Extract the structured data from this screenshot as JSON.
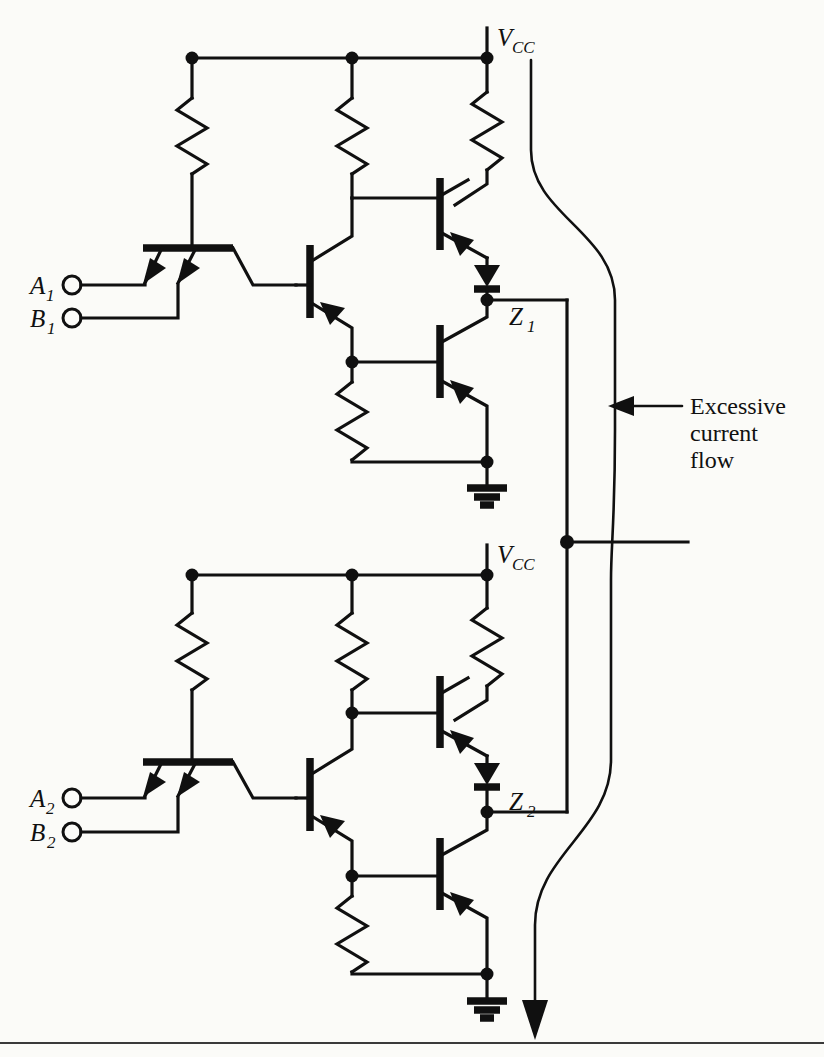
{
  "figure": {
    "background_color": "#fbfbf8",
    "ink_color": "#101010"
  },
  "labels": {
    "supply_top": {
      "symbol": "V",
      "subscript": "CC"
    },
    "supply_bottom": {
      "symbol": "V",
      "subscript": "CC"
    },
    "input_a1": {
      "symbol": "A",
      "subscript": "1"
    },
    "input_b1": {
      "symbol": "B",
      "subscript": "1"
    },
    "input_a2": {
      "symbol": "A",
      "subscript": "2"
    },
    "input_b2": {
      "symbol": "B",
      "subscript": "2"
    },
    "output_z1": {
      "symbol": "Z",
      "subscript": "1"
    },
    "output_z2": {
      "symbol": "Z",
      "subscript": "2"
    }
  },
  "annotation": {
    "line1": "Excessive",
    "line2": "current",
    "line3": "flow"
  },
  "components": {
    "gate_top": {
      "name": "TTL NAND gate 1",
      "resistors": [
        "R1 input pull-up",
        "R2 collector load",
        "R3 totem-pole upper",
        "R4 emitter resistor"
      ],
      "transistors": [
        "Q1 multi-emitter input",
        "Q2 phase splitter",
        "Q3 totem-pole upper",
        "Q4 totem-pole lower"
      ],
      "diodes": [
        "D1 level-shift diode"
      ],
      "ground": "GND"
    },
    "gate_bottom": {
      "name": "TTL NAND gate 2",
      "resistors": [
        "R1 input pull-up",
        "R2 collector load",
        "R3 totem-pole upper",
        "R4 emitter resistor"
      ],
      "transistors": [
        "Q1 multi-emitter input",
        "Q2 phase splitter",
        "Q3 totem-pole upper",
        "Q4 totem-pole lower"
      ],
      "diodes": [
        "D1 level-shift diode"
      ],
      "ground": "GND"
    },
    "tie_node": "Outputs Z1 and Z2 wired together"
  },
  "icons": {
    "supply_rail": "vcc-rail-icon",
    "ground": "ground-icon",
    "junction": "junction-dot-icon",
    "terminal": "input-terminal-icon",
    "current_arrow": "current-flow-arrow-icon",
    "callout_arrow": "callout-arrow-icon"
  }
}
